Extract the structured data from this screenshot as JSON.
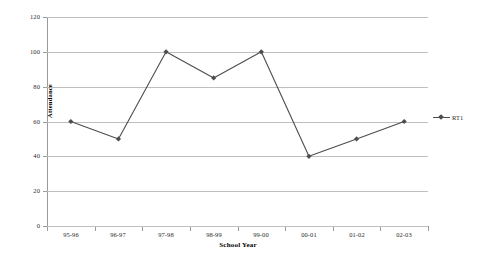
{
  "chart_data": {
    "type": "line",
    "title": "",
    "xlabel": "School Year",
    "ylabel": "Attendance",
    "categories": [
      "95-96",
      "96-97",
      "97-98",
      "98-99",
      "99-00",
      "00-01",
      "01-02",
      "02-03"
    ],
    "series": [
      {
        "name": "RT1",
        "values": [
          60,
          50,
          100,
          85,
          100,
          40,
          50,
          60
        ],
        "color": "#4d4d4d",
        "marker": "diamond"
      }
    ],
    "ylim": [
      0,
      120
    ],
    "yticks": [
      0,
      20,
      40,
      60,
      80,
      100,
      120
    ],
    "ytick_labels": [
      "0",
      "20",
      "40",
      "60",
      "80",
      "100",
      "120"
    ],
    "grid": "horizontal",
    "legend_position": "right",
    "background_color": "#ffffff",
    "gridline_color": "#bfbfbf",
    "axis_color": "#9a9a9a"
  },
  "legend": {
    "entries": [
      {
        "label": "RT1"
      }
    ]
  }
}
